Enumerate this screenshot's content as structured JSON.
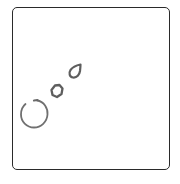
{
  "drawing": {
    "frame_color": "#2a2a2a",
    "stroke_color": "#6b6b6b",
    "shapes": [
      {
        "name": "large-open-circle",
        "cx": 34,
        "cy": 114,
        "r": 13
      },
      {
        "name": "medium-blob",
        "cx": 57,
        "cy": 91,
        "r": 6
      },
      {
        "name": "small-teardrop",
        "cx": 74,
        "cy": 72
      }
    ]
  }
}
